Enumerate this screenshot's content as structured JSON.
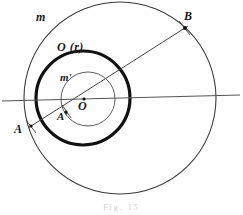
{
  "figure": {
    "caption": "Fig. 15",
    "canvas": {
      "width": 243,
      "height": 215
    },
    "labels": {
      "outer_circle": "m",
      "thick_circle": "O (r)",
      "inner_circle": "m'",
      "center": "O",
      "point_a": "A",
      "point_a_prime": "A'",
      "point_b": "B"
    },
    "colors": {
      "ink": "#1a1a1a",
      "thin_stroke": "#3a3a3a",
      "thick_stroke": "#111111",
      "secant_stroke": "#555555",
      "background": "#fefefe"
    },
    "shapes": {
      "outer_circle": {
        "cx": 120,
        "cy": 98,
        "r": 96,
        "stroke_width": 1.1
      },
      "thick_circle": {
        "cx": 83,
        "cy": 98,
        "r": 47,
        "stroke_width": 3.2
      },
      "inner_circle": {
        "cx": 88,
        "cy": 99,
        "r": 27,
        "stroke_width": 0.9
      },
      "secant_line": {
        "x1": 2,
        "y1": 101,
        "x2": 240,
        "y2": 95,
        "stroke_width": 1.2
      },
      "diagonal_line": {
        "x1": 28,
        "y1": 128,
        "x2": 188,
        "y2": 26,
        "stroke_width": 1.0
      }
    },
    "points": {
      "a": {
        "cx": 31,
        "cy": 126
      },
      "a_prime": {
        "cx": 66,
        "cy": 112
      },
      "b": {
        "cx": 185,
        "cy": 28
      },
      "center": {
        "cx": 84,
        "cy": 99
      }
    }
  }
}
